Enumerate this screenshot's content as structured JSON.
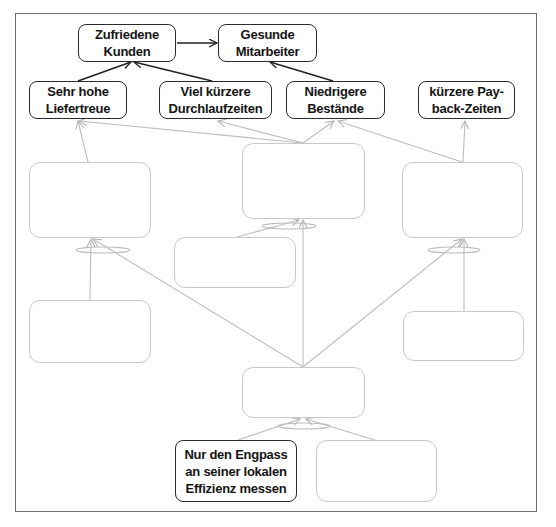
{
  "diagram": {
    "colors": {
      "frame": "#6e6e6e",
      "dark_border": "#2b2b2b",
      "light_border": "#c9c9c9",
      "dark_link": "#222222",
      "light_link": "#bbbbbb",
      "text": "#141414"
    },
    "nodes": [
      {
        "id": "zufriedene-kunden",
        "label": "Zufriedene\nKunden",
        "style": "dark"
      },
      {
        "id": "gesunde-mitarbeiter",
        "label": "Gesunde\nMitarbeiter",
        "style": "dark"
      },
      {
        "id": "sehr-hohe-liefertreue",
        "label": "Sehr hohe\nLiefertreue",
        "style": "dark"
      },
      {
        "id": "viel-kuerzere-durchlaufzeiten",
        "label": "Viel kürzere\nDurchlaufzeiten",
        "style": "dark"
      },
      {
        "id": "niedrigere-bestaende",
        "label": "Niedrigere\nBestände",
        "style": "dark"
      },
      {
        "id": "kuerzere-payback-zeiten",
        "label": "kürzere Pay-\nback-Zeiten",
        "style": "dark"
      },
      {
        "id": "empty-left-middle",
        "label": "",
        "style": "light"
      },
      {
        "id": "empty-center-top",
        "label": "",
        "style": "light"
      },
      {
        "id": "empty-right-middle",
        "label": "",
        "style": "light"
      },
      {
        "id": "empty-small-center-left",
        "label": "",
        "style": "light"
      },
      {
        "id": "empty-left-lower",
        "label": "",
        "style": "light"
      },
      {
        "id": "empty-right-lower",
        "label": "",
        "style": "light"
      },
      {
        "id": "empty-center-bottom",
        "label": "",
        "style": "light"
      },
      {
        "id": "nur-den-engpass",
        "label": "Nur den Engpass\nan seiner lokalen\nEffizienz messen",
        "style": "dark"
      },
      {
        "id": "empty-bottom-right",
        "label": "",
        "style": "light"
      }
    ],
    "edges": [
      {
        "from": "zufriedene-kunden",
        "to": "gesunde-mitarbeiter",
        "style": "dark"
      },
      {
        "from": "sehr-hohe-liefertreue",
        "to": "zufriedene-kunden",
        "style": "dark"
      },
      {
        "from": "viel-kuerzere-durchlaufzeiten",
        "to": "zufriedene-kunden",
        "style": "dark"
      },
      {
        "from": "niedrigere-bestaende",
        "to": "gesunde-mitarbeiter",
        "style": "dark"
      },
      {
        "from": "empty-left-middle",
        "to": "sehr-hohe-liefertreue",
        "style": "light"
      },
      {
        "from": "empty-center-top",
        "to": "sehr-hohe-liefertreue",
        "style": "light"
      },
      {
        "from": "empty-center-top",
        "to": "viel-kuerzere-durchlaufzeiten",
        "style": "light"
      },
      {
        "from": "empty-center-top",
        "to": "niedrigere-bestaende",
        "style": "light"
      },
      {
        "from": "empty-right-middle",
        "to": "niedrigere-bestaende",
        "style": "light"
      },
      {
        "from": "empty-right-middle",
        "to": "kuerzere-payback-zeiten",
        "style": "light"
      },
      {
        "from": "empty-left-lower",
        "to": "empty-left-middle",
        "style": "light",
        "and_connector": true
      },
      {
        "from": "empty-center-bottom",
        "to": "empty-left-middle",
        "style": "light",
        "and_connector": true
      },
      {
        "from": "empty-small-center-left",
        "to": "empty-center-top",
        "style": "light",
        "and_connector": true
      },
      {
        "from": "empty-center-bottom",
        "to": "empty-center-top",
        "style": "light",
        "and_connector": true
      },
      {
        "from": "empty-center-bottom",
        "to": "empty-right-middle",
        "style": "light",
        "and_connector": true
      },
      {
        "from": "empty-right-lower",
        "to": "empty-right-middle",
        "style": "light",
        "and_connector": true
      },
      {
        "from": "nur-den-engpass",
        "to": "empty-center-bottom",
        "style": "light",
        "and_connector": true
      },
      {
        "from": "empty-bottom-right",
        "to": "empty-center-bottom",
        "style": "light",
        "and_connector": true
      }
    ]
  }
}
